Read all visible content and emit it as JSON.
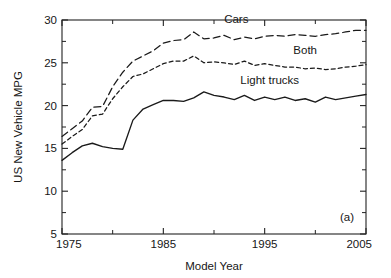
{
  "chart_data": {
    "type": "line",
    "title": "",
    "panel_label": "(a)",
    "xlabel": "Model Year",
    "ylabel": "US New Vehicle MPG",
    "xlim": [
      1975,
      2005
    ],
    "ylim": [
      5,
      30
    ],
    "grid": false,
    "legend_position": "inline-annotations",
    "x_major_ticks": [
      1975,
      1985,
      1995,
      2005
    ],
    "x_major_tick_labels": [
      "1975",
      "1985",
      "1995",
      "2005"
    ],
    "x_minor_ticks": [
      1980,
      1990,
      2000
    ],
    "y_major_ticks": [
      5,
      10,
      15,
      20,
      25,
      30
    ],
    "y_major_tick_labels": [
      "5",
      "10",
      "15",
      "20",
      "25",
      "30"
    ],
    "y_minor_ticks": [
      7.5,
      12.5,
      17.5,
      22.5,
      27.5
    ],
    "x": [
      1975,
      1976,
      1977,
      1978,
      1979,
      1980,
      1981,
      1982,
      1983,
      1984,
      1985,
      1986,
      1987,
      1988,
      1989,
      1990,
      1991,
      1992,
      1993,
      1994,
      1995,
      1996,
      1997,
      1998,
      1999,
      2000,
      2001,
      2002,
      2003,
      2004,
      2005
    ],
    "series": [
      {
        "name": "Cars",
        "label": "Cars",
        "style": "long-dashed",
        "label_x": 1992.2,
        "label_y": 29.6,
        "values": [
          16.4,
          17.3,
          18.2,
          19.8,
          19.9,
          22.2,
          23.9,
          25.2,
          25.8,
          26.4,
          27.3,
          27.6,
          27.7,
          28.6,
          27.8,
          27.9,
          28.2,
          27.7,
          28.0,
          27.8,
          28.1,
          28.2,
          28.1,
          28.3,
          28.2,
          28.1,
          28.3,
          28.4,
          28.6,
          28.8,
          28.8
        ]
      },
      {
        "name": "Both",
        "label": "Both",
        "style": "short-dashed",
        "label_x": 1999.0,
        "label_y": 26.0,
        "values": [
          15.5,
          16.4,
          17.2,
          18.8,
          19.0,
          20.8,
          22.2,
          23.4,
          23.7,
          24.3,
          24.9,
          25.2,
          25.2,
          25.8,
          25.0,
          25.1,
          25.0,
          24.8,
          25.2,
          24.7,
          24.9,
          24.7,
          24.5,
          24.5,
          24.3,
          24.4,
          24.2,
          24.3,
          24.5,
          24.6,
          24.8
        ]
      },
      {
        "name": "Light trucks",
        "label": "Light trucks",
        "style": "solid",
        "label_x": 1995.5,
        "label_y": 22.5,
        "values": [
          13.6,
          14.5,
          15.3,
          15.6,
          15.2,
          15.0,
          14.9,
          18.3,
          19.6,
          20.1,
          20.6,
          20.6,
          20.5,
          20.9,
          21.6,
          21.2,
          21.0,
          20.7,
          21.2,
          20.6,
          21.0,
          20.7,
          21.0,
          20.6,
          20.8,
          20.4,
          21.0,
          20.7,
          20.9,
          21.1,
          21.3
        ]
      }
    ]
  },
  "plot_geometry": {
    "left_px": 62,
    "right_px": 366,
    "top_px": 20,
    "bottom_px": 234
  },
  "colors": {
    "axis": "#222222",
    "curve": "#1a1a1a",
    "background": "#ffffff"
  }
}
